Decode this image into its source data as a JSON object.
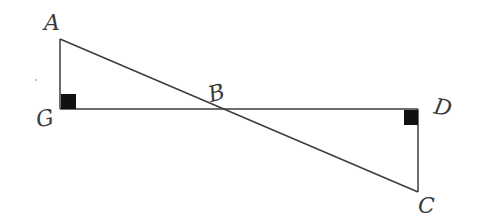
{
  "diagram": {
    "type": "geometry",
    "points": {
      "A": {
        "x": 60,
        "y": 39,
        "label": "A"
      },
      "G": {
        "x": 60,
        "y": 109,
        "label": "G"
      },
      "B": {
        "x": 229,
        "y": 109,
        "label": "B"
      },
      "D": {
        "x": 418,
        "y": 109,
        "label": "D"
      },
      "C": {
        "x": 418,
        "y": 192,
        "label": "C"
      }
    },
    "segments": [
      {
        "from": "A",
        "to": "G"
      },
      {
        "from": "G",
        "to": "D"
      },
      {
        "from": "A",
        "to": "C"
      },
      {
        "from": "D",
        "to": "C"
      }
    ],
    "right_angles": [
      "G",
      "D"
    ],
    "labels": {
      "A": "A",
      "G": "G",
      "B": "B",
      "D": "D",
      "C": "C"
    },
    "colors": {
      "line": "#3c3c3c",
      "marker": "#111111",
      "label": "#3a3a3a"
    }
  }
}
